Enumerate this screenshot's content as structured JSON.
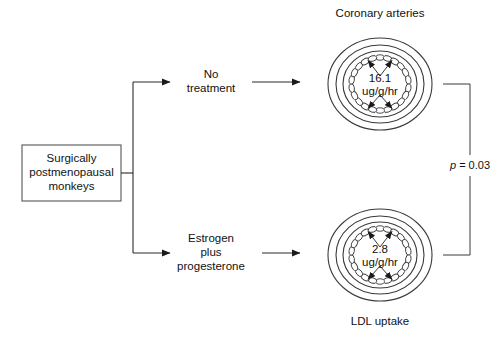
{
  "figure": {
    "source_box": {
      "lines": [
        "Surgically",
        "postmenopausal",
        "monkeys"
      ]
    },
    "branches": [
      {
        "id": "no-treatment",
        "label_lines": [
          "No",
          "treatment"
        ],
        "vessel": {
          "title": "Coronary arteries",
          "value": "16.1",
          "units": "ug/g/hr",
          "caption": ""
        }
      },
      {
        "id": "estrogen-plus-progesterone",
        "label_lines": [
          "Estrogen",
          "plus",
          "progesterone"
        ],
        "vessel": {
          "title": "",
          "value": "2.8",
          "units": "ug/g/hr",
          "caption": "LDL uptake"
        }
      }
    ],
    "comparison": {
      "p_symbol": "p",
      "p_equals": " = 0.03"
    },
    "colors": {
      "line": "#2b2b2b",
      "box_border": "#555555",
      "text": "#111111",
      "background": "#ffffff"
    }
  }
}
